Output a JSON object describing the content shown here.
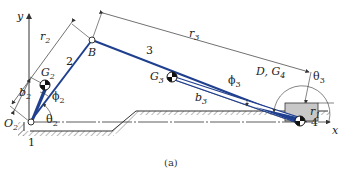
{
  "figure": {
    "caption": "(a)",
    "colors": {
      "link": "#1f3f8f",
      "dim": "#333333",
      "block": "#c8c8c8",
      "ground_hatch": "#666666"
    }
  },
  "axes": {
    "x_label": "x",
    "y_label": "y"
  },
  "links": {
    "ground": {
      "number": "1"
    },
    "crank": {
      "number": "2"
    },
    "coupler": {
      "number": "3"
    },
    "slider": {
      "number": "4"
    }
  },
  "points": {
    "O2": {
      "main": "O",
      "sub": "2"
    },
    "B": {
      "main": "B"
    },
    "G2": {
      "main": "G",
      "sub": "2"
    },
    "G3": {
      "main": "G",
      "sub": "3"
    },
    "D_G4": {
      "main": "D, G",
      "sub": "4"
    }
  },
  "dimensions": {
    "r1": {
      "main": "r",
      "sub": "1"
    },
    "r2": {
      "main": "r",
      "sub": "2"
    },
    "r3": {
      "main": "r",
      "sub": "3"
    },
    "b2": {
      "main": "b",
      "sub": "2"
    },
    "b3": {
      "main": "b",
      "sub": "3"
    }
  },
  "angles": {
    "theta2": {
      "main": "θ",
      "sub": "2"
    },
    "theta3": {
      "main": "θ",
      "sub": "3"
    },
    "phi2": {
      "main": "ϕ",
      "sub": "2"
    },
    "phi3": {
      "main": "ϕ",
      "sub": "3"
    }
  }
}
